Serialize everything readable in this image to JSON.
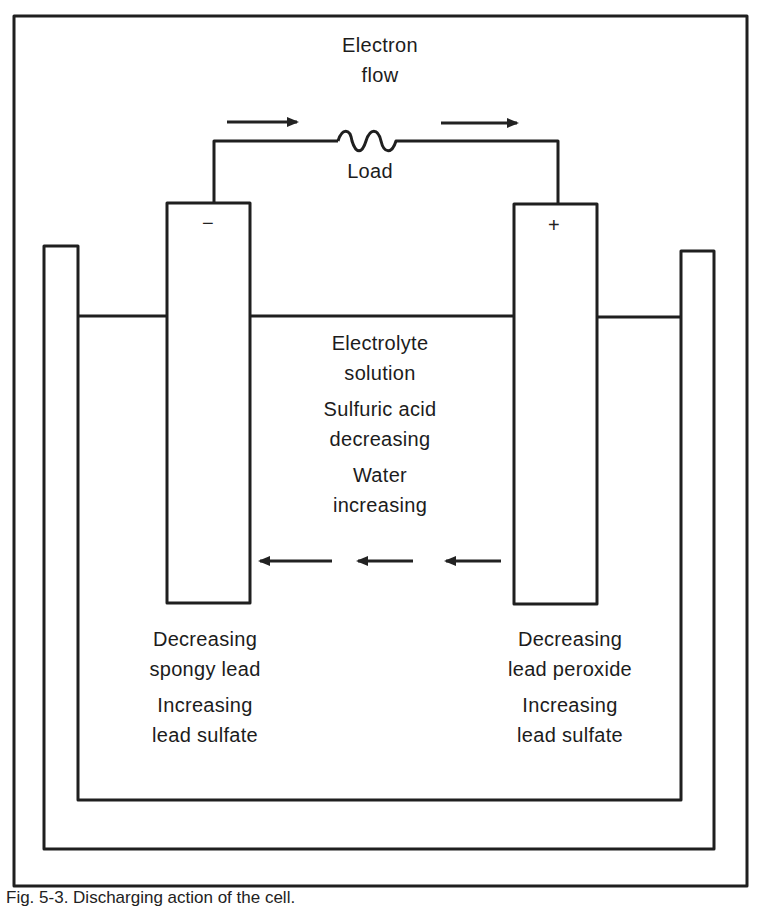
{
  "circuit": {
    "electron_flow_label_line1": "Electron",
    "electron_flow_label_line2": "flow",
    "load_label": "Load",
    "negative_terminal": "−",
    "positive_terminal": "+"
  },
  "electrolyte": {
    "line1": "Electrolyte",
    "line2": "solution",
    "acid_line1": "Sulfuric acid",
    "acid_line2": "decreasing",
    "water_line1": "Water",
    "water_line2": "increasing"
  },
  "negative_plate": {
    "line1": "Decreasing",
    "line2": "spongy lead",
    "line3": "Increasing",
    "line4": "lead sulfate"
  },
  "positive_plate": {
    "line1": "Decreasing",
    "line2": "lead peroxide",
    "line3": "Increasing",
    "line4": "lead sulfate"
  },
  "caption": "Fig. 5-3. Discharging action of the cell.",
  "colors": {
    "stroke": "#1f1f1f",
    "background": "#ffffff"
  }
}
